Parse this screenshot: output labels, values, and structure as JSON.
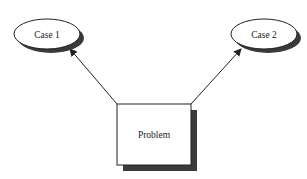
{
  "diagram": {
    "type": "concept-diagram",
    "colors": {
      "background": "#ffffff",
      "stroke": "#222222",
      "shadow": "#3a3a3a",
      "fill": "#ffffff"
    },
    "nodes": [
      {
        "id": "case1",
        "shape": "ellipse",
        "label": "Case 1",
        "cx": 47,
        "cy": 34,
        "rx": 33,
        "ry": 15
      },
      {
        "id": "case2",
        "shape": "ellipse",
        "label": "Case 2",
        "cx": 264,
        "cy": 34,
        "rx": 33,
        "ry": 15
      },
      {
        "id": "problem",
        "shape": "rectangle",
        "label": "Problem",
        "x": 117,
        "y": 104,
        "width": 74,
        "height": 61
      }
    ],
    "edges": [
      {
        "from": "problem",
        "to": "case1",
        "arrow": "end"
      },
      {
        "from": "problem",
        "to": "case2",
        "arrow": "end"
      }
    ]
  }
}
